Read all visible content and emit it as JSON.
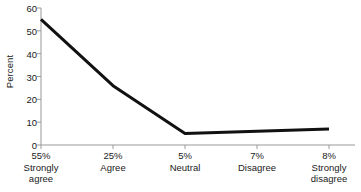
{
  "chart_data": {
    "type": "line",
    "title": "",
    "subtitle": "",
    "xlabel": "",
    "ylabel": "Percent",
    "ylim": [
      0,
      60
    ],
    "yticks": [
      0,
      10,
      20,
      30,
      40,
      50,
      60
    ],
    "grid": false,
    "legend": null,
    "categories": [
      "Strongly agree",
      "Agree",
      "Neutral",
      "Disagree",
      "Strongly disagree"
    ],
    "category_lines": [
      [
        "Strongly",
        "agree"
      ],
      [
        "Agree",
        ""
      ],
      [
        "Neutral",
        ""
      ],
      [
        "Disagree",
        ""
      ],
      [
        "Strongly",
        "disagree"
      ]
    ],
    "point_labels": [
      "55%",
      "25%",
      "5%",
      "7%",
      "8%"
    ],
    "values": [
      55,
      26,
      5,
      6,
      7
    ],
    "series": [
      {
        "name": "Percent",
        "color": "#111111",
        "values": [
          55,
          26,
          5,
          6,
          7
        ]
      }
    ],
    "line_color": "#111111",
    "line_width": 3,
    "axis_color": "#999999"
  },
  "axis": {
    "y_title": "Percent",
    "y_tick_labels": [
      "60",
      "50",
      "40",
      "30",
      "20",
      "10",
      "0"
    ]
  },
  "x_axis": {
    "items": [
      {
        "pct": "55%",
        "line1": "Strongly",
        "line2": "agree"
      },
      {
        "pct": "25%",
        "line1": "Agree",
        "line2": ""
      },
      {
        "pct": "5%",
        "line1": "Neutral",
        "line2": ""
      },
      {
        "pct": "7%",
        "line1": "Disagree",
        "line2": ""
      },
      {
        "pct": "8%",
        "line1": "Strongly",
        "line2": "disagree"
      }
    ]
  }
}
